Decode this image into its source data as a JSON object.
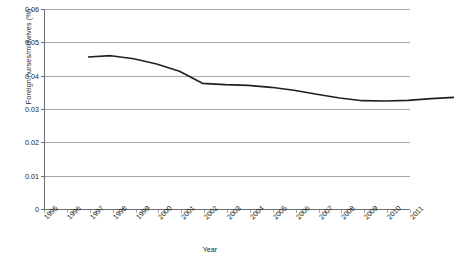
{
  "chart_data": {
    "type": "line",
    "title": "",
    "xlabel": "Year",
    "ylabel": "Foreign nurses/midwives (%)",
    "categories": [
      "1995",
      "1996",
      "1997",
      "1998",
      "1999",
      "2000",
      "2001",
      "2002",
      "2003",
      "2004",
      "2005",
      "2006",
      "2007",
      "2008",
      "2009",
      "2010",
      "2011"
    ],
    "values": [
      0.0483,
      0.0487,
      0.0478,
      0.0462,
      0.044,
      0.0404,
      0.04,
      0.0398,
      0.0392,
      0.0383,
      0.0371,
      0.036,
      0.0352,
      0.0351,
      0.0353,
      0.0358,
      0.0362
    ],
    "series": [
      {
        "name": "Foreign nurses/midwives (%)",
        "values": [
          0.0483,
          0.0487,
          0.0478,
          0.0462,
          0.044,
          0.0404,
          0.04,
          0.0398,
          0.0392,
          0.0383,
          0.0371,
          0.036,
          0.0352,
          0.0351,
          0.0353,
          0.0358,
          0.0362
        ]
      }
    ],
    "ylim": [
      0,
      0.06
    ],
    "yticks": [
      "0",
      "0.01",
      "0.02",
      "0.03",
      "0.04",
      "0.05",
      "0.06"
    ],
    "ytick_values": [
      0,
      0.01,
      0.02,
      0.03,
      0.04,
      0.05,
      0.06
    ],
    "grid": true,
    "legend": "none",
    "line_color": "#231f20",
    "grid_color": "#a7a9ac",
    "axis_color": "#6d6e71"
  }
}
